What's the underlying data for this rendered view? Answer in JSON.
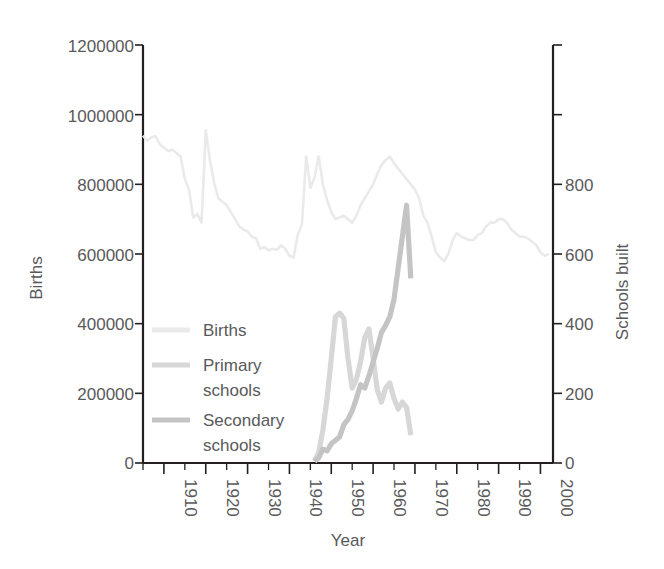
{
  "chart_data": {
    "type": "line",
    "title": "",
    "xlabel": "Year",
    "ylabel": "Births",
    "y2label": "Schools built",
    "xlim": [
      1905,
      2003
    ],
    "ylim": [
      0,
      1200000
    ],
    "y2lim": [
      0,
      1200
    ],
    "grid": false,
    "legend_position": "inside-lower-left",
    "x_tick_labels": [
      "1910",
      "1920",
      "1930",
      "1940",
      "1950",
      "1960",
      "1970",
      "1980",
      "1990",
      "2000"
    ],
    "x_ticks": [
      1910,
      1920,
      1930,
      1940,
      1950,
      1960,
      1970,
      1980,
      1990,
      2000
    ],
    "x_minor_ticks": [
      1905,
      1915,
      1925,
      1935,
      1945,
      1955,
      1965,
      1975,
      1985,
      1995
    ],
    "y_tick_labels": [
      "0",
      "200000",
      "400000",
      "600000",
      "800000",
      "1000000",
      "1200000"
    ],
    "y_ticks": [
      0,
      200000,
      400000,
      600000,
      800000,
      1000000,
      1200000
    ],
    "y2_tick_labels": [
      "0",
      "200",
      "400",
      "600",
      "800",
      "",
      ""
    ],
    "y2_ticks": [
      0,
      200,
      400,
      600,
      800,
      1000,
      1200
    ],
    "series": [
      {
        "name": "Births",
        "axis": "left",
        "color": "#eaeaea",
        "x": [
          1905,
          1906,
          1907,
          1908,
          1909,
          1910,
          1911,
          1912,
          1913,
          1914,
          1915,
          1916,
          1917,
          1918,
          1919,
          1920,
          1921,
          1922,
          1923,
          1924,
          1925,
          1926,
          1927,
          1928,
          1929,
          1930,
          1931,
          1932,
          1933,
          1934,
          1935,
          1936,
          1937,
          1938,
          1939,
          1940,
          1941,
          1942,
          1943,
          1944,
          1945,
          1946,
          1947,
          1948,
          1949,
          1950,
          1951,
          1952,
          1953,
          1954,
          1955,
          1956,
          1957,
          1958,
          1959,
          1960,
          1961,
          1962,
          1963,
          1964,
          1965,
          1966,
          1967,
          1968,
          1969,
          1970,
          1971,
          1972,
          1973,
          1974,
          1975,
          1976,
          1977,
          1978,
          1979,
          1980,
          1981,
          1982,
          1983,
          1984,
          1985,
          1986,
          1987,
          1988,
          1989,
          1990,
          1991,
          1992,
          1993,
          1994,
          1995,
          1996,
          1997,
          1998,
          1999,
          2000,
          2001,
          2002
        ],
        "y": [
          940000,
          925000,
          935000,
          938000,
          915000,
          905000,
          895000,
          900000,
          890000,
          880000,
          815000,
          785000,
          705000,
          715000,
          690000,
          955000,
          870000,
          805000,
          760000,
          750000,
          740000,
          720000,
          700000,
          680000,
          670000,
          665000,
          650000,
          645000,
          615000,
          620000,
          610000,
          615000,
          612000,
          625000,
          615000,
          595000,
          590000,
          655000,
          685000,
          880000,
          790000,
          820000,
          880000,
          800000,
          755000,
          720000,
          700000,
          705000,
          710000,
          700000,
          690000,
          710000,
          740000,
          760000,
          780000,
          800000,
          830000,
          855000,
          870000,
          880000,
          860000,
          845000,
          830000,
          815000,
          800000,
          785000,
          760000,
          710000,
          690000,
          650000,
          605000,
          590000,
          580000,
          600000,
          640000,
          660000,
          650000,
          645000,
          640000,
          640000,
          655000,
          660000,
          680000,
          690000,
          690000,
          700000,
          700000,
          690000,
          670000,
          660000,
          650000,
          650000,
          645000,
          635000,
          625000,
          605000,
          595000,
          600000
        ]
      },
      {
        "name": "Primary schools",
        "axis": "right",
        "color": "#d7d7d7",
        "x": [
          1946,
          1947,
          1948,
          1949,
          1950,
          1951,
          1952,
          1953,
          1954,
          1955,
          1956,
          1957,
          1958,
          1959,
          1960,
          1961,
          1962,
          1963,
          1964,
          1965,
          1966,
          1967,
          1968,
          1969
        ],
        "y": [
          5,
          30,
          95,
          185,
          300,
          420,
          430,
          415,
          300,
          215,
          240,
          290,
          360,
          385,
          300,
          210,
          175,
          215,
          230,
          185,
          155,
          175,
          160,
          80
        ]
      },
      {
        "name": "Secondary schools",
        "axis": "right",
        "color": "#c4c4c4",
        "x": [
          1946,
          1947,
          1948,
          1949,
          1950,
          1951,
          1952,
          1953,
          1954,
          1955,
          1956,
          1957,
          1958,
          1959,
          1960,
          1961,
          1962,
          1963,
          1964,
          1965,
          1966,
          1967,
          1968,
          1969
        ],
        "y": [
          5,
          15,
          40,
          35,
          55,
          65,
          75,
          110,
          125,
          150,
          185,
          225,
          215,
          250,
          290,
          330,
          375,
          395,
          420,
          470,
          560,
          650,
          740,
          530
        ]
      }
    ]
  },
  "legend": {
    "items": [
      {
        "label": "Births",
        "color": "#eaeaea"
      },
      {
        "label": "Primary schools",
        "color": "#d7d7d7"
      },
      {
        "label": "Secondary schools",
        "color": "#c4c4c4"
      }
    ],
    "entry_lines": [
      [
        "Births"
      ],
      [
        "Primary",
        "schools"
      ],
      [
        "Secondary",
        "schools"
      ]
    ]
  },
  "labels": {
    "y_axis_title": "Births",
    "y2_axis_title": "Schools built",
    "x_axis_title": "Year",
    "y_0": "0",
    "y_200000": "200000",
    "y_400000": "400000",
    "y_600000": "600000",
    "y_800000": "800000",
    "y_1000000": "1000000",
    "y_1200000": "1200000",
    "y2_0": "0",
    "y2_200": "200",
    "y2_400": "400",
    "y2_600": "600",
    "y2_800": "800",
    "x_1910": "1910",
    "x_1920": "1920",
    "x_1930": "1930",
    "x_1940": "1940",
    "x_1950": "1950",
    "x_1960": "1960",
    "x_1970": "1970",
    "x_1980": "1980",
    "x_1990": "1990",
    "x_2000": "2000",
    "legend_births": "Births",
    "legend_primary_1": "Primary",
    "legend_primary_2": "schools",
    "legend_secondary_1": "Secondary",
    "legend_secondary_2": "schools"
  }
}
